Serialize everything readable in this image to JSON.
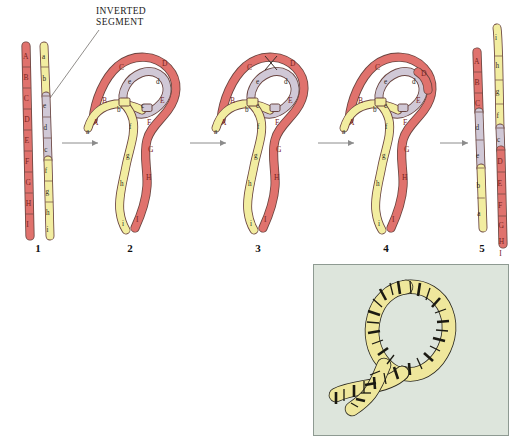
{
  "figure": {
    "title_callout": "INVERTED SEGMENT",
    "callout_line1": "INVERTED",
    "callout_line2": "SEGMENT",
    "type": "chromosome-inversion-crossing-over-diagram"
  },
  "colors": {
    "red_chromatid": "#e0726d",
    "red_chromatid_dark": "#c4524d",
    "yellow_chromatid": "#f2eda0",
    "yellow_chromatid_dark": "#cdc46a",
    "gray_inverted": "#d0c8d6",
    "gray_inverted_dark": "#9a93a3",
    "outline": "#4a3a38",
    "arrow": "#8c8c8c",
    "inset_background": "#dde5dc",
    "inset_border": "#8e9a92",
    "inset_band": "#1b1a12",
    "inset_chromosome": "#efe79c",
    "label_red": "#7a2420",
    "label_dark": "#2b2520"
  },
  "steps": [
    {
      "number": "1",
      "name": "unpaired-homologs"
    },
    {
      "number": "2",
      "name": "inversion-loop-pairing"
    },
    {
      "number": "3",
      "name": "crossover-within-loop"
    },
    {
      "number": "4",
      "name": "after-crossover"
    },
    {
      "number": "5",
      "name": "recombinant-products"
    }
  ],
  "panel1": {
    "normal_chromosome": {
      "name": "normal-homolog",
      "color": "red_chromatid",
      "loci": [
        "A",
        "B",
        "C",
        "D",
        "E",
        "F",
        "G",
        "H",
        "I"
      ]
    },
    "inverted_chromosome": {
      "name": "inversion-homolog",
      "color": "yellow_chromatid",
      "loci_top": [
        "a",
        "b"
      ],
      "loci_inverted": [
        "e",
        "d",
        "c"
      ],
      "loci_bottom": [
        "f",
        "g",
        "h",
        "i"
      ]
    }
  },
  "panel2": {
    "red_loci": [
      "A",
      "B",
      "C",
      "D",
      "E",
      "F",
      "G",
      "H",
      "I"
    ],
    "yellow_loci": [
      "a",
      "b",
      "f",
      "g",
      "h",
      "i"
    ],
    "gray_loci": [
      "c",
      "d",
      "e"
    ]
  },
  "panel3": {
    "red_loci": [
      "A",
      "B",
      "C",
      "D",
      "E",
      "F",
      "G",
      "H",
      "I"
    ],
    "yellow_loci": [
      "a",
      "b",
      "f",
      "g",
      "h",
      "i"
    ],
    "gray_loci": [
      "c",
      "d",
      "e"
    ],
    "crossover_marker": "X"
  },
  "panel4": {
    "red_loci": [
      "A",
      "B",
      "C",
      "D",
      "E",
      "F",
      "G",
      "H",
      "I"
    ],
    "yellow_loci": [
      "a",
      "b",
      "f",
      "g",
      "h",
      "i"
    ],
    "gray_loci": [
      "c",
      "d",
      "e"
    ]
  },
  "panel5": {
    "left_product": {
      "name": "recombinant-chromosome-left",
      "red_loci": [
        "A",
        "B",
        "C"
      ],
      "gray_loci": [
        "d",
        "e"
      ],
      "yellow_loci": [
        "b",
        "a"
      ]
    },
    "right_product": {
      "name": "recombinant-chromosome-right",
      "yellow_loci": [
        "i",
        "h",
        "g",
        "f"
      ],
      "gray_loci": [
        "c"
      ],
      "red_loci": [
        "D",
        "E",
        "F",
        "G",
        "H",
        "I"
      ]
    }
  },
  "inset": {
    "name": "polytene-inversion-loop-micrograph",
    "caption": ""
  }
}
